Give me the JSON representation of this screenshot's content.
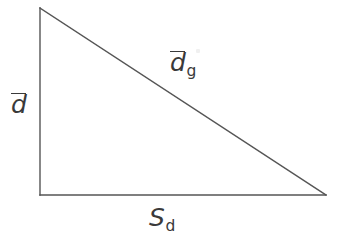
{
  "figure": {
    "type": "right-triangle-diagram",
    "background_color": "#ffffff",
    "stroke_color": "#555555",
    "text_color": "#3a3a3a",
    "stroke_width_px": 1.4,
    "width_px": 339,
    "height_px": 244
  },
  "geometry": {
    "apex_top_left": {
      "x": 40,
      "y": 8
    },
    "right_angle_corner_bottom_left": {
      "x": 40,
      "y": 195
    },
    "vertex_bottom_right": {
      "x": 326,
      "y": 195
    },
    "vertical_leg_length_px": 187,
    "horizontal_leg_length_px": 286
  },
  "labels": {
    "vertical_leg": {
      "base": "d",
      "subscript": "",
      "has_overbar": true,
      "rendered": "d̄",
      "describes": "vertical-leg"
    },
    "hypotenuse": {
      "base": "d",
      "subscript": "g",
      "has_overbar": true,
      "rendered": "d̄g",
      "describes": "hypotenuse"
    },
    "horizontal_leg": {
      "base": "S",
      "subscript": "d",
      "has_overbar": false,
      "rendered": "Sd",
      "describes": "horizontal-leg"
    }
  }
}
